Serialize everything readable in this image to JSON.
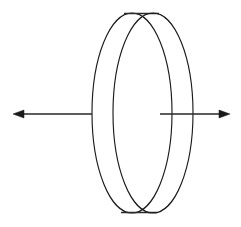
{
  "figure": {
    "background_color": "#ffffff",
    "stroke_color": "#1c1c1c",
    "arrow_color": "#262626",
    "canvas": {
      "width": 241,
      "height": 227
    }
  },
  "shapes": {
    "back_face": {
      "name": "back-disc-face",
      "type": "ellipse",
      "cx": 132,
      "cy": 113,
      "rx": 40,
      "ry": 100
    },
    "front_face": {
      "name": "front-disc-face",
      "type": "ellipse",
      "cx": 153,
      "cy": 113,
      "rx": 40,
      "ry": 100
    },
    "top_edge": {
      "name": "top-edge-connector",
      "type": "line",
      "x1": 124,
      "y1": 13.5,
      "x2": 159,
      "y2": 13.5
    },
    "bottom_edge": {
      "name": "bottom-edge-connector",
      "type": "line",
      "x1": 121,
      "y1": 212.5,
      "x2": 157,
      "y2": 212.5
    }
  },
  "arrows": {
    "left": {
      "name": "left-axis-arrow",
      "direction": "left",
      "tail_x": 92,
      "tip_x": 13,
      "y": 114,
      "head_length": 11,
      "head_half_width": 4
    },
    "right": {
      "name": "right-axis-arrow",
      "direction": "right",
      "tail_x": 160,
      "tip_x": 230,
      "y": 114,
      "head_length": 11,
      "head_half_width": 4
    }
  }
}
